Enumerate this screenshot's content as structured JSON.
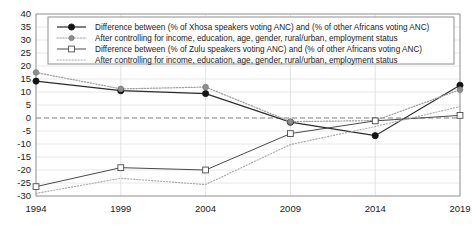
{
  "chart_data": {
    "type": "line",
    "title": "",
    "xlabel": "",
    "ylabel": "",
    "x": [
      1994,
      1999,
      2004,
      2009,
      2014,
      2019
    ],
    "xtick_labels": [
      "1994",
      "1999",
      "2004",
      "2009",
      "2014",
      "2019"
    ],
    "ytick_labels": [
      "40",
      "35",
      "30",
      "25",
      "20",
      "15",
      "10",
      "5",
      "0",
      "-5",
      "-10",
      "-15",
      "-20",
      "-25",
      "-30"
    ],
    "ytick_values": [
      40,
      35,
      30,
      25,
      20,
      15,
      10,
      5,
      0,
      -5,
      -10,
      -15,
      -20,
      -25,
      -30
    ],
    "ylim": [
      -30,
      40
    ],
    "xlim": [
      1994,
      2019
    ],
    "grid": true,
    "legend_position": "top-inside",
    "zero_reference_line": 0,
    "series": [
      {
        "name": "Difference between (% of Xhosa speakers voting ANC) and (% of other Africans voting ANC)",
        "style": "solid",
        "marker": "filled-circle",
        "color": "#2b2b2b",
        "values": [
          14.2,
          10.5,
          9.4,
          -1.6,
          -6.8,
          12.6
        ]
      },
      {
        "name": "After controlling for income, education, age, gender, rural/urban, employment status",
        "style": "dotted",
        "marker": "grey-circle",
        "color": "#9d9d9d",
        "values": [
          17.5,
          11.2,
          11.9,
          -1.4,
          -1.0,
          10.9
        ]
      },
      {
        "name": "Difference between (% of Zulu speakers voting ANC) and (% of other Africans voting ANC)",
        "style": "solid",
        "marker": "open-square",
        "color": "#4a4a4a",
        "values": [
          -26.4,
          -19.1,
          -20.0,
          -6.0,
          -1.1,
          1.0
        ]
      },
      {
        "name": "After controlling for income, education, age, gender, rural/urban, employment status",
        "style": "dotted",
        "marker": "none",
        "color": "#a8a8a8",
        "values": [
          -29.0,
          -23.2,
          -25.6,
          -10.2,
          -3.3,
          4.4
        ]
      }
    ]
  },
  "legend": {
    "entries": [
      {
        "label": "Difference between (% of Xhosa speakers voting ANC) and (% of other Africans voting ANC)",
        "sample": "solid-filled-circle"
      },
      {
        "label": "After controlling for income, education, age, gender, rural/urban, employment status",
        "sample": "dotted-grey-circle"
      },
      {
        "label": "Difference between (% of Zulu speakers voting ANC) and (% of other Africans voting ANC)",
        "sample": "solid-open-square"
      },
      {
        "label": "After controlling for income, education, age, gender, rural/urban, employment status",
        "sample": "dotted-plain"
      }
    ]
  },
  "colors": {
    "series_1": "#2b2b2b",
    "series_2": "#9d9d9d",
    "series_3": "#4a4a4a",
    "series_4": "#a8a8a8",
    "grid": "#e2e2e2",
    "frame": "#9a9a9a",
    "zero_line": "#8c8c8c",
    "background": "#ffffff",
    "text": "#1a1a1a"
  }
}
